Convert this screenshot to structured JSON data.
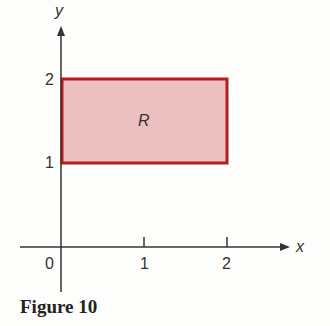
{
  "figure": {
    "caption": "Figure 10",
    "region_label": "R",
    "axes": {
      "x_label": "x",
      "y_label": "y"
    },
    "x_ticks": [
      "0",
      "1",
      "2"
    ],
    "y_ticks": [
      "1",
      "2"
    ],
    "region": {
      "x_range": [
        0,
        2
      ],
      "y_range": [
        1,
        2
      ],
      "fill": "#e8b9b9",
      "stroke": "#b22222"
    }
  }
}
